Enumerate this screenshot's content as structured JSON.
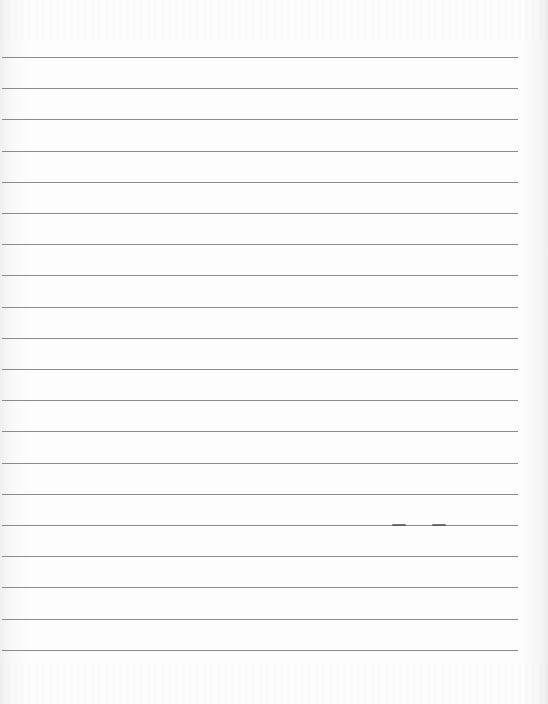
{
  "page": {
    "type": "blank lined paper",
    "line_count": 20,
    "line_color": "#8a8a8a",
    "paper_color": "#fdfdfd",
    "text": ""
  }
}
